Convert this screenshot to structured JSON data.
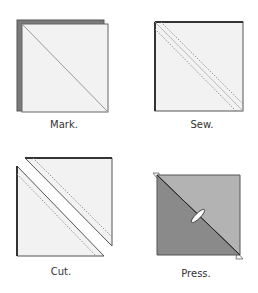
{
  "diagram": {
    "steps": [
      {
        "id": "mark",
        "label": "Mark."
      },
      {
        "id": "sew",
        "label": "Sew."
      },
      {
        "id": "cut",
        "label": "Cut."
      },
      {
        "id": "press",
        "label": "Press."
      }
    ],
    "colors": {
      "background": "#ffffff",
      "light_fabric": "#f1f1f1",
      "dark_fabric": "#7a7a7a",
      "pressed_dark": "#8a8a8a",
      "pressed_light": "#b3b3b3",
      "outline": "#555555",
      "edge_dark": "#333333",
      "stitch": "#888888"
    }
  }
}
